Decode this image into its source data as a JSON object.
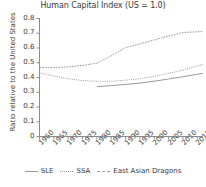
{
  "chart_data": {
    "type": "line",
    "title": "Human Capital Index (US = 1.0)",
    "xlabel": "",
    "ylabel": "Ratio relative to the United States",
    "xlim": [
      1960,
      2017
    ],
    "ylim": [
      0,
      0.8
    ],
    "grid": false,
    "legend_position": "bottom",
    "x_ticks": [
      "1960",
      "1965",
      "1970",
      "1975",
      "1980",
      "1985",
      "1990",
      "1995",
      "2000",
      "2005",
      "2010",
      "2015"
    ],
    "y_ticks": [
      "0",
      "0.1",
      "0.2",
      "0.3",
      "0.4",
      "0.5",
      "0.6",
      "0.7",
      "0.8"
    ],
    "series": [
      {
        "name": "SLE",
        "style": "solid",
        "color": "#9a9a9a",
        "x": [
          1980,
          1985,
          1990,
          1995,
          2000,
          2005,
          2010,
          2015,
          2017
        ],
        "values": [
          0.338,
          0.345,
          0.353,
          0.362,
          0.375,
          0.39,
          0.405,
          0.422,
          0.428
        ]
      },
      {
        "name": "SSA",
        "style": "dotted",
        "color": "#9a9a9a",
        "x": [
          1960,
          1965,
          1970,
          1975,
          1980,
          1985,
          1990,
          1995,
          2000,
          2005,
          2010,
          2015,
          2017
        ],
        "values": [
          0.432,
          0.41,
          0.392,
          0.379,
          0.374,
          0.375,
          0.382,
          0.392,
          0.408,
          0.428,
          0.45,
          0.478,
          0.488
        ]
      },
      {
        "name": "East Asian Dragons",
        "style": "dashed",
        "color": "#9a9a9a",
        "x": [
          1960,
          1965,
          1970,
          1975,
          1980,
          1985,
          1990,
          1995,
          2000,
          2005,
          2010,
          2015,
          2017
        ],
        "values": [
          0.468,
          0.468,
          0.472,
          0.482,
          0.497,
          0.547,
          0.602,
          0.628,
          0.655,
          0.682,
          0.705,
          0.71,
          0.711
        ]
      }
    ]
  },
  "legend": {
    "items": [
      {
        "label": "SLE"
      },
      {
        "label": "SSA"
      },
      {
        "label": "East Asian Dragons"
      }
    ]
  }
}
